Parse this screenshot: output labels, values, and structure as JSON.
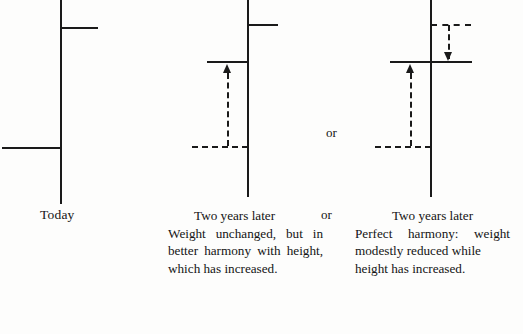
{
  "figure": {
    "title_text_present": false,
    "panels": [
      {
        "id": "today",
        "label": "Today",
        "axis_x": 60,
        "marks": [
          {
            "kind": "solid-bar",
            "meaning": "height",
            "y": 27,
            "from_x": 60,
            "to_x": 98
          },
          {
            "kind": "solid-bar",
            "meaning": "weight",
            "y": 147,
            "from_x": 2,
            "to_x": 60
          }
        ]
      },
      {
        "id": "two-years-later-unchanged",
        "axis_x": 247,
        "marks": [
          {
            "kind": "solid-bar",
            "meaning": "height",
            "y": 24,
            "from_x": 247,
            "to_x": 277
          },
          {
            "kind": "solid-bar",
            "meaning": "weight-new",
            "y": 61,
            "from_x": 207,
            "to_x": 247
          },
          {
            "kind": "dashed-bar",
            "meaning": "weight-old",
            "y": 146,
            "from_x": 192,
            "to_x": 247
          },
          {
            "kind": "arrow-up",
            "meaning": "weight-rises-relative",
            "x": 227,
            "from_y": 146,
            "to_y": 64
          }
        ]
      },
      {
        "id": "two-years-later-perfect",
        "axis_x": 430,
        "marks": [
          {
            "kind": "dashed-bar",
            "meaning": "height-old",
            "y": 24,
            "from_x": 430,
            "to_x": 470
          },
          {
            "kind": "arrow-down",
            "meaning": "height-reference-drops",
            "x": 448,
            "from_y": 26,
            "to_y": 59
          },
          {
            "kind": "solid-bar",
            "meaning": "height-and-weight",
            "y": 61,
            "from_x": 390,
            "to_x": 472
          },
          {
            "kind": "dashed-bar",
            "meaning": "weight-old",
            "y": 146,
            "from_x": 375,
            "to_x": 430
          },
          {
            "kind": "arrow-up",
            "meaning": "weight-modestly-reduced",
            "x": 410,
            "from_y": 146,
            "to_y": 64
          }
        ]
      }
    ],
    "connectors": {
      "or_between_diagrams": "or",
      "or_between_captions": "or"
    },
    "captions": {
      "middle": {
        "heading": "Two years later",
        "body": "Weight unchanged, but in better harmony with height, which has increased."
      },
      "right": {
        "heading": "Two years later",
        "body_line_1": "Perfect harmony: weight",
        "body_line_2": "modestly reduced while",
        "body_line_3": "height has increased."
      }
    },
    "colors": {
      "ink": "#1a1a1a",
      "paper": "#fdfdfc"
    }
  }
}
